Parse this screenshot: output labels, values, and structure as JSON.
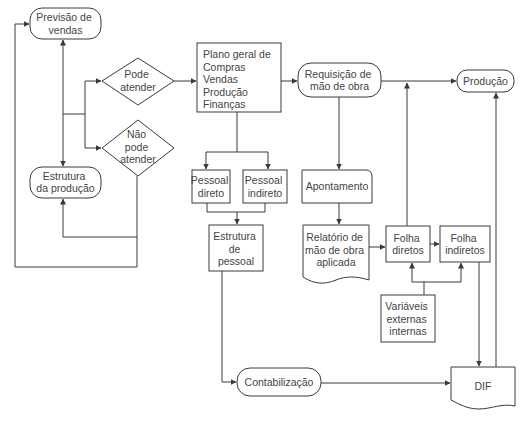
{
  "diagram": {
    "colors": {
      "line": "#3a3a3a",
      "text": "#444444",
      "background": "#ffffff"
    },
    "nodes": {
      "previsao_vendas": {
        "shape": "terminator",
        "lines": [
          "Previsão de",
          "vendas"
        ]
      },
      "pode_atender": {
        "shape": "decision",
        "lines": [
          "Pode",
          "atender"
        ]
      },
      "nao_pode_atender": {
        "shape": "decision",
        "lines": [
          "Não",
          "pode",
          "atender"
        ]
      },
      "estrutura_producao": {
        "shape": "terminator",
        "lines": [
          "Estrutura",
          "da produção"
        ]
      },
      "plano_geral": {
        "shape": "process",
        "lines": [
          "Plano geral de",
          "Compras",
          "Vendas",
          "Produção",
          "Finanças"
        ]
      },
      "requisicao_mao_obra": {
        "shape": "terminator",
        "lines": [
          "Requisição de",
          "mão de obra"
        ]
      },
      "producao": {
        "shape": "terminator",
        "lines": [
          "Produção"
        ]
      },
      "pessoal_direto": {
        "shape": "process",
        "lines": [
          "Pessoal",
          "direto"
        ]
      },
      "pessoal_indireto": {
        "shape": "process",
        "lines": [
          "Pessoal",
          "indireto"
        ]
      },
      "estrutura_pessoal": {
        "shape": "process",
        "lines": [
          "Estrutura",
          "de",
          "pessoal"
        ]
      },
      "apontamento": {
        "shape": "card",
        "lines": [
          "Apontamento"
        ]
      },
      "relatorio_mao_obra": {
        "shape": "document",
        "lines": [
          "Relatório de",
          "mão de obra",
          "aplicada"
        ]
      },
      "folha_diretos": {
        "shape": "process",
        "lines": [
          "Folha",
          "diretos"
        ]
      },
      "folha_indiretos": {
        "shape": "process",
        "lines": [
          "Folha",
          "indiretos"
        ]
      },
      "variaveis": {
        "shape": "process",
        "lines": [
          "Variáveis",
          "externas",
          "internas"
        ]
      },
      "contabilizacao": {
        "shape": "terminator",
        "lines": [
          "Contabilização"
        ]
      },
      "dif": {
        "shape": "document",
        "lines": [
          "DIF"
        ]
      }
    },
    "edges": [
      {
        "from": "previsao_vendas",
        "to": "estrutura_producao",
        "bidirectional": true
      },
      {
        "from": "previsao_vendas",
        "to": "pode_atender"
      },
      {
        "from": "previsao_vendas",
        "to": "nao_pode_atender"
      },
      {
        "from": "pode_atender",
        "to": "plano_geral"
      },
      {
        "from": "nao_pode_atender",
        "to": "estrutura_producao"
      },
      {
        "from": "nao_pode_atender",
        "to": "previsao_vendas"
      },
      {
        "from": "plano_geral",
        "to": "requisicao_mao_obra"
      },
      {
        "from": "plano_geral",
        "to": "pessoal_direto"
      },
      {
        "from": "plano_geral",
        "to": "pessoal_indireto"
      },
      {
        "from": "pessoal_direto",
        "to": "estrutura_pessoal"
      },
      {
        "from": "pessoal_indireto",
        "to": "estrutura_pessoal"
      },
      {
        "from": "estrutura_pessoal",
        "to": "contabilizacao"
      },
      {
        "from": "contabilizacao",
        "to": "dif"
      },
      {
        "from": "requisicao_mao_obra",
        "to": "producao"
      },
      {
        "from": "requisicao_mao_obra",
        "to": "apontamento"
      },
      {
        "from": "apontamento",
        "to": "relatorio_mao_obra"
      },
      {
        "from": "relatorio_mao_obra",
        "to": "folha_diretos"
      },
      {
        "from": "folha_diretos",
        "to": "folha_indiretos"
      },
      {
        "from": "folha_diretos",
        "to": "producao"
      },
      {
        "from": "variaveis",
        "to": "folha_diretos"
      },
      {
        "from": "variaveis",
        "to": "folha_indiretos"
      },
      {
        "from": "folha_indiretos",
        "to": "dif"
      },
      {
        "from": "dif",
        "to": "producao"
      }
    ]
  }
}
